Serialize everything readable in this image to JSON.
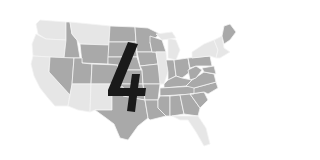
{
  "map": {
    "title": "United States map",
    "overlay_number": "4",
    "colors": {
      "background": "#ffffff",
      "light_region": "#e6e6e6",
      "dark_region": "#a9a9a9",
      "border": "#f4f4f4",
      "number": "#1a1a1a"
    },
    "light_regions": [
      "WA",
      "OR",
      "CA",
      "MT",
      "AZ",
      "NM",
      "IL",
      "MI",
      "FL",
      "NY",
      "New England"
    ],
    "dark_regions": [
      "ID",
      "NV",
      "UT",
      "WY",
      "CO",
      "ND",
      "SD",
      "NE",
      "KS",
      "OK",
      "TX",
      "MN",
      "WI",
      "IA",
      "MO",
      "AR",
      "LA",
      "MS",
      "AL",
      "GA",
      "SC",
      "NC",
      "TN",
      "KY",
      "IN",
      "OH",
      "WV",
      "VA",
      "PA",
      "MD",
      "ME"
    ]
  }
}
